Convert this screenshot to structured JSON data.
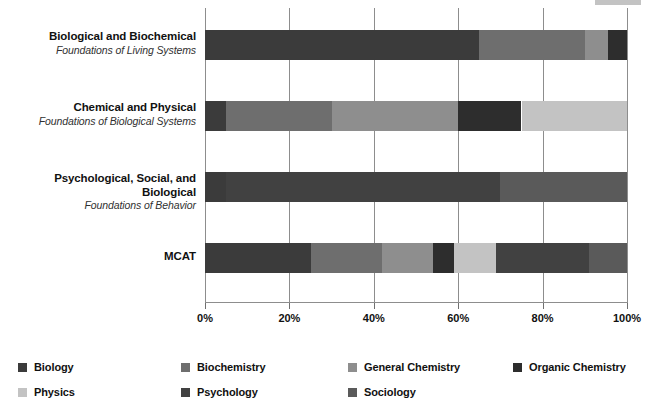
{
  "chart_data": {
    "type": "bar",
    "orientation": "horizontal",
    "stacked": true,
    "stack_mode": "percent",
    "title": "",
    "subtitle": "",
    "xlabel": "",
    "ylabel": "",
    "xlim": [
      0,
      100
    ],
    "xticks": [
      0,
      20,
      40,
      60,
      80,
      100
    ],
    "xtick_labels": [
      "0%",
      "20%",
      "40%",
      "60%",
      "80%",
      "100%"
    ],
    "grid": true,
    "grid_axis": "x",
    "legend_position": "bottom",
    "categories": [
      "Biological and Biochemical Foundations of Living Systems",
      "Chemical and Physical Foundations of Biological Systems",
      "Psychological, Social, and Biological Foundations of Behavior",
      "MCAT"
    ],
    "category_rows": [
      {
        "title": "Biological and Biochemical",
        "subtitle": "Foundations of Living Systems"
      },
      {
        "title": "Chemical and Physical",
        "subtitle": "Foundations of Biological Systems"
      },
      {
        "title": "Psychological, Social, and Biological",
        "subtitle": "Foundations of Behavior"
      },
      {
        "title": "MCAT",
        "subtitle": ""
      }
    ],
    "series": [
      {
        "name": "Biology",
        "color": "#3b3b3b",
        "values": [
          65,
          5,
          5,
          25
        ]
      },
      {
        "name": "Biochemistry",
        "color": "#6e6e6e",
        "values": [
          25,
          25,
          0,
          17
        ]
      },
      {
        "name": "General Chemistry",
        "color": "#8e8e8e",
        "values": [
          5.5,
          30,
          0,
          12
        ]
      },
      {
        "name": "Organic Chemistry",
        "color": "#2d2d2d",
        "values": [
          4.5,
          15,
          0,
          5
        ]
      },
      {
        "name": "Physics",
        "color": "#c3c3c3",
        "values": [
          0,
          25,
          0,
          10
        ]
      },
      {
        "name": "Psychology",
        "color": "#414141",
        "values": [
          0,
          0,
          65,
          22
        ]
      },
      {
        "name": "Sociology",
        "color": "#5a5a5a",
        "values": [
          0,
          0,
          30,
          9
        ]
      }
    ],
    "legend_entries": [
      {
        "label": "Biology",
        "color": "#3b3b3b"
      },
      {
        "label": "Biochemistry",
        "color": "#6e6e6e"
      },
      {
        "label": "General Chemistry",
        "color": "#8e8e8e"
      },
      {
        "label": "Organic Chemistry",
        "color": "#2d2d2d"
      },
      {
        "label": "Physics",
        "color": "#c3c3c3"
      },
      {
        "label": "Psychology",
        "color": "#414141"
      },
      {
        "label": "Sociology",
        "color": "#5a5a5a"
      }
    ]
  },
  "colors": {
    "background": "#ffffff",
    "axis": "#8d8d8d",
    "text": "#111111",
    "subtitle_text": "#303030"
  }
}
